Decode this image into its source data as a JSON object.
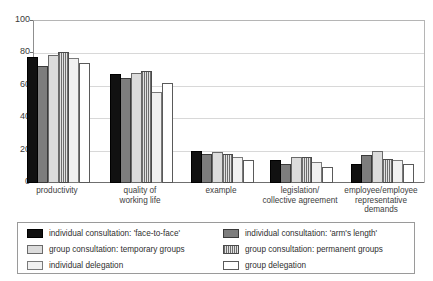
{
  "top_clipped_text": "ﬁgure caption (clipped)",
  "chart_data": {
    "type": "bar",
    "title": "",
    "xlabel": "",
    "ylabel": "",
    "ylim": [
      0,
      100
    ],
    "yticks": [
      0,
      20,
      40,
      60,
      80,
      100
    ],
    "grid": true,
    "legend_position": "bottom",
    "categories": [
      "productivity",
      "quality of\nworking life",
      "example",
      "legislation/\ncollective agreement",
      "employee/employee\nrepresentative\ndemands"
    ],
    "series": [
      {
        "name": "individual consultation: 'face-to-face'",
        "color": "#111111",
        "pattern": "solid-black",
        "values": [
          78,
          67,
          20,
          14,
          12
        ]
      },
      {
        "name": "individual consultation: 'arm's length'",
        "color": "#7d7d7d",
        "pattern": "solid-dark-gray",
        "values": [
          72,
          65,
          18,
          12,
          17
        ]
      },
      {
        "name": "group consultation: temporary groups",
        "color": "#dcdcdc",
        "pattern": "solid-light-gray",
        "values": [
          79,
          68,
          19,
          16,
          20
        ]
      },
      {
        "name": "group consultation: permanent groups",
        "color": "#e2e2e2",
        "pattern": "vertical-hatch",
        "values": [
          81,
          69,
          18,
          16,
          15
        ]
      },
      {
        "name": "individual delegation",
        "color": "#f1f1f1",
        "pattern": "solid-very-light-gray",
        "values": [
          77,
          56,
          16,
          13,
          14
        ]
      },
      {
        "name": "group delegation",
        "color": "#ffffff",
        "pattern": "outline-white",
        "values": [
          74,
          62,
          14,
          10,
          12
        ]
      }
    ]
  },
  "axis": {
    "y_tick_labels": [
      "100",
      "80",
      "60",
      "40",
      "20",
      "0"
    ]
  },
  "x_axis_labels": [
    {
      "lines": [
        "productivity"
      ]
    },
    {
      "lines": [
        "quality of",
        "working life"
      ]
    },
    {
      "lines": [
        "example"
      ]
    },
    {
      "lines": [
        "legislation/",
        "collective agreement"
      ]
    },
    {
      "lines": [
        "employee/employee",
        "representative",
        "demands"
      ]
    }
  ],
  "legend": {
    "entries": [
      {
        "label": "individual consultation: 'face-to-face'",
        "swatch": 0,
        "col": "a",
        "row": 1
      },
      {
        "label": "individual consultation: 'arm's length'",
        "swatch": 1,
        "col": "b",
        "row": 1
      },
      {
        "label": "group consultation: temporary groups",
        "swatch": 2,
        "col": "a",
        "row": 2
      },
      {
        "label": "group consultation: permanent groups",
        "swatch": 3,
        "col": "b",
        "row": 2
      },
      {
        "label": "individual delegation",
        "swatch": 4,
        "col": "a",
        "row": 3
      },
      {
        "label": "group delegation",
        "swatch": 5,
        "col": "b",
        "row": 3
      }
    ]
  }
}
